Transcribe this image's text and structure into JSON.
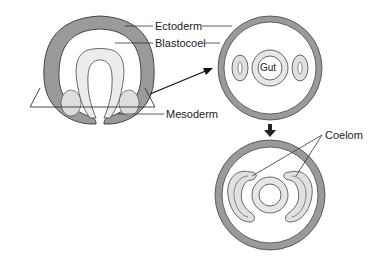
{
  "diagram": {
    "labels": {
      "ectoderm": "Ectoderm",
      "blastocoel": "Blastocoel",
      "mesoderm": "Mesoderm",
      "gut": "Gut",
      "coelom": "Coelom"
    },
    "colors": {
      "ectoderm_fill": "#9a9a9a",
      "mesoderm_fill": "#e0e0e0",
      "gut_fill": "#e6e6e6",
      "outline": "#444444",
      "background": "#ffffff"
    }
  }
}
